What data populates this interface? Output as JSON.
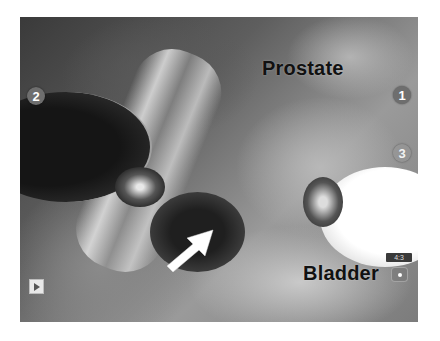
{
  "image": {
    "description": "Grayscale laparoscopic surgical view showing prostate and bladder with instruments",
    "colors": {
      "background": "#ffffff",
      "label_text": "#111111",
      "marker_bg": "#6e6e6e"
    }
  },
  "labels": {
    "prostate": "Prostate",
    "bladder": "Bladder"
  },
  "markers": [
    {
      "id": "1",
      "label": "1"
    },
    {
      "id": "2",
      "label": "2"
    },
    {
      "id": "3",
      "label": "3"
    }
  ],
  "controls": {
    "play_icon": "play-icon",
    "aspect_ratio": "4:3",
    "small_control_icon": "record-icon"
  },
  "annotations": {
    "arrow": "white arrow pointing up-right toward the prostate-bladder junction"
  }
}
